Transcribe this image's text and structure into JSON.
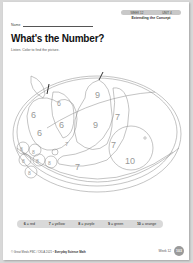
{
  "header": {
    "week_label": "WEEK 12",
    "unit_label": "UNIT 4",
    "section": "Extending the Concept",
    "name_label": "Name"
  },
  "title": "What's the Number?",
  "instructions": "Listen. Color to find the picture.",
  "picture": {
    "regions": [
      {
        "fruit": "apple",
        "numbers": [
          "6",
          "6",
          "6"
        ]
      },
      {
        "fruit": "apple-highlight",
        "numbers": [
          "6"
        ]
      },
      {
        "fruit": "pear",
        "numbers": [
          "9",
          "9"
        ]
      },
      {
        "fruit": "banana",
        "numbers": [
          "7",
          "7",
          "7"
        ]
      },
      {
        "fruit": "orange",
        "numbers": [
          "10"
        ]
      },
      {
        "fruit": "grapes",
        "numbers": [
          "8",
          "8",
          "8",
          "8",
          "8"
        ]
      }
    ]
  },
  "color_key": [
    {
      "number": "6",
      "color": "red"
    },
    {
      "number": "7",
      "color": "yellow"
    },
    {
      "number": "8",
      "color": "purple"
    },
    {
      "number": "9",
      "color": "green"
    },
    {
      "number": "10",
      "color": "orange"
    }
  ],
  "footer": {
    "copyright": "© Great Minds PBC / CKLA 2021 •",
    "book": "Everyday Science Math",
    "week": "Week 12",
    "page_number": "103"
  }
}
